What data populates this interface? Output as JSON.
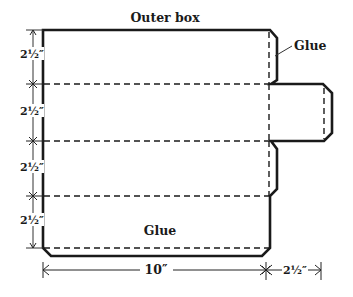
{
  "title": "Outer box",
  "labels": {
    "glue_side": "Glue",
    "glue_bottom": "Glue"
  },
  "dimensions": {
    "row_1": "2½″",
    "row_2": "2½″",
    "row_3": "2½″",
    "row_4": "2½″",
    "width": "10″",
    "flap_width": "2½″"
  },
  "colors": {
    "line": "#1a1a1a",
    "fill": "#ededed"
  }
}
